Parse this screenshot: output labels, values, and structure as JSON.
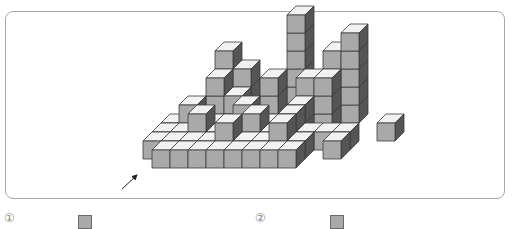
{
  "figure": {
    "cube_size": 18,
    "depth_dx": 9,
    "depth_dy": -9,
    "origin_x": 152,
    "origin_y": 150,
    "colors": {
      "front": "#a9a9a9",
      "top": "#f2f2f2",
      "side": "#555555",
      "edge": "#3a3a3a",
      "frame": "#a8a8a8"
    },
    "cubes": [
      {
        "c": 0,
        "d": 0,
        "h": 0
      },
      {
        "c": 1,
        "d": 0,
        "h": 0
      },
      {
        "c": 2,
        "d": 0,
        "h": 0
      },
      {
        "c": 3,
        "d": 0,
        "h": 0
      },
      {
        "c": 4,
        "d": 0,
        "h": 0
      },
      {
        "c": 5,
        "d": 0,
        "h": 0
      },
      {
        "c": 6,
        "d": 0,
        "h": 0
      },
      {
        "c": 7,
        "d": 0,
        "h": 0
      },
      {
        "c": -1,
        "d": 1,
        "h": 0
      },
      {
        "c": 0,
        "d": 1,
        "h": 0
      },
      {
        "c": 1,
        "d": 1,
        "h": 0
      },
      {
        "c": 2,
        "d": 1,
        "h": 0
      },
      {
        "c": 3,
        "d": 1,
        "h": 0
      },
      {
        "c": 4,
        "d": 1,
        "h": 0
      },
      {
        "c": 5,
        "d": 1,
        "h": 0
      },
      {
        "c": 6,
        "d": 1,
        "h": 0
      },
      {
        "c": 7,
        "d": 1,
        "h": 0
      },
      {
        "c": 3,
        "d": 1,
        "h": 1
      },
      {
        "c": 6,
        "d": 1,
        "h": 1
      },
      {
        "c": -1,
        "d": 2,
        "h": 0
      },
      {
        "c": 0,
        "d": 2,
        "h": 0
      },
      {
        "c": 1,
        "d": 2,
        "h": 0
      },
      {
        "c": 2,
        "d": 2,
        "h": 0
      },
      {
        "c": 3,
        "d": 2,
        "h": 0
      },
      {
        "c": 4,
        "d": 2,
        "h": 0
      },
      {
        "c": 5,
        "d": 2,
        "h": 0
      },
      {
        "c": 6,
        "d": 2,
        "h": 0
      },
      {
        "c": 7,
        "d": 2,
        "h": 0
      },
      {
        "c": 8,
        "d": 2,
        "h": 0
      },
      {
        "c": 9,
        "d": 2,
        "h": 0
      },
      {
        "c": 1,
        "d": 2,
        "h": 1
      },
      {
        "c": 4,
        "d": 2,
        "h": 1
      },
      {
        "c": 6,
        "d": 2,
        "h": 1
      },
      {
        "c": 9,
        "d": 1,
        "h": 0
      },
      {
        "c": 11,
        "d": 3,
        "h": 0
      },
      {
        "c": -1,
        "d": 3,
        "h": 0
      },
      {
        "c": 0,
        "d": 3,
        "h": 0
      },
      {
        "c": 1,
        "d": 3,
        "h": 0
      },
      {
        "c": 2,
        "d": 3,
        "h": 0
      },
      {
        "c": 3,
        "d": 3,
        "h": 0
      },
      {
        "c": 4,
        "d": 3,
        "h": 0
      },
      {
        "c": 5,
        "d": 3,
        "h": 0
      },
      {
        "c": 6,
        "d": 3,
        "h": 0
      },
      {
        "c": 0,
        "d": 3,
        "h": 1
      },
      {
        "c": 3,
        "d": 3,
        "h": 1
      },
      {
        "c": 6,
        "d": 3,
        "h": 1
      },
      {
        "c": 1,
        "d": 4,
        "h": 0
      },
      {
        "c": 2,
        "d": 4,
        "h": 0
      },
      {
        "c": 3,
        "d": 4,
        "h": 0
      },
      {
        "c": 4,
        "d": 4,
        "h": 0
      },
      {
        "c": 5,
        "d": 4,
        "h": 0
      },
      {
        "c": 6,
        "d": 4,
        "h": 0
      },
      {
        "c": 7,
        "d": 4,
        "h": 0
      },
      {
        "c": 1,
        "d": 4,
        "h": 1
      },
      {
        "c": 2,
        "d": 4,
        "h": 1
      },
      {
        "c": 4,
        "d": 4,
        "h": 1
      },
      {
        "c": 6,
        "d": 4,
        "h": 1
      },
      {
        "c": 7,
        "d": 4,
        "h": 1
      },
      {
        "c": 1,
        "d": 4,
        "h": 2
      },
      {
        "c": 4,
        "d": 4,
        "h": 2
      },
      {
        "c": 7,
        "d": 4,
        "h": 2
      },
      {
        "c": 6,
        "d": 4,
        "h": 2
      },
      {
        "c": 1,
        "d": 5,
        "h": 0
      },
      {
        "c": 1,
        "d": 5,
        "h": 1
      },
      {
        "c": 1,
        "d": 5,
        "h": 2
      },
      {
        "c": 1,
        "d": 5,
        "h": 3
      },
      {
        "c": 2,
        "d": 5,
        "h": 0
      },
      {
        "c": 2,
        "d": 5,
        "h": 1
      },
      {
        "c": 2,
        "d": 5,
        "h": 2
      },
      {
        "c": 5,
        "d": 5,
        "h": 0
      },
      {
        "c": 5,
        "d": 5,
        "h": 1
      },
      {
        "c": 5,
        "d": 5,
        "h": 2
      },
      {
        "c": 5,
        "d": 5,
        "h": 3
      },
      {
        "c": 5,
        "d": 5,
        "h": 4
      },
      {
        "c": 5,
        "d": 5,
        "h": 5
      },
      {
        "c": 7,
        "d": 5,
        "h": 0
      },
      {
        "c": 7,
        "d": 5,
        "h": 1
      },
      {
        "c": 7,
        "d": 5,
        "h": 2
      },
      {
        "c": 7,
        "d": 5,
        "h": 3
      },
      {
        "c": 8,
        "d": 5,
        "h": 0
      },
      {
        "c": 8,
        "d": 5,
        "h": 1
      },
      {
        "c": 8,
        "d": 5,
        "h": 2
      },
      {
        "c": 8,
        "d": 5,
        "h": 3
      },
      {
        "c": 8,
        "d": 5,
        "h": 4
      }
    ],
    "view_arrow": {
      "x1": 122,
      "y1": 189,
      "x2": 137,
      "y2": 175,
      "label": "view-direction"
    }
  },
  "options": [
    {
      "number": "①",
      "square_color": "#aaaaaa"
    },
    {
      "number": "②",
      "square_color": "#aaaaaa"
    }
  ]
}
